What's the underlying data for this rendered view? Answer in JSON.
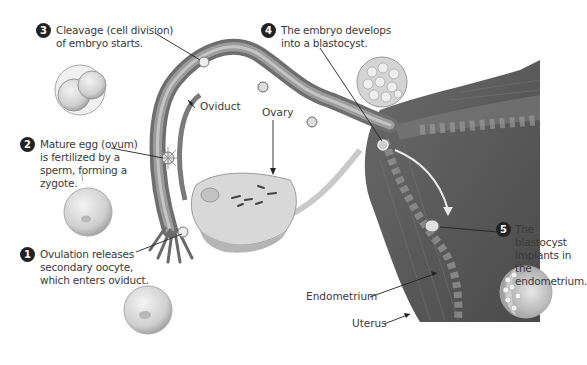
{
  "diagram": {
    "steps": [
      {
        "number": "1",
        "text": "Ovulation releases\nsecondary oocyte,\nwhich enters oviduct."
      },
      {
        "number": "2",
        "text": "Mature egg (ovum)\nis fertilized by a\nsperm, forming a\nzygote."
      },
      {
        "number": "3",
        "text": "Cleavage (cell division)\nof embryo starts."
      },
      {
        "number": "4",
        "text": "The embryo develops\ninto a blastocyst."
      },
      {
        "number": "5",
        "text": "The blastocyst\nimplants in the\nendometrium."
      }
    ],
    "structure_labels": {
      "oviduct": "Oviduct",
      "ovary": "Ovary",
      "endometrium": "Endometrium",
      "uterus": "Uterus"
    },
    "colors": {
      "badge": "#222222",
      "tissue_dark": "#5a5a5a",
      "tissue_mid": "#8a8a8a",
      "tissue_light": "#bdbdbd",
      "ovary_fill": "#d6d6d6",
      "cell_fill": "#cfcfcf"
    }
  }
}
